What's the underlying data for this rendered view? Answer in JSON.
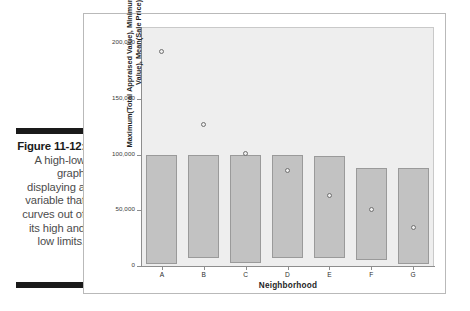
{
  "caption": {
    "figure_number": "Figure 11-12:",
    "body": "A high-low graph displaying a variable that curves out of its high and low limits."
  },
  "chart_data": {
    "type": "bar",
    "title": "",
    "subtitle": "",
    "xlabel": "Neighborhood",
    "ylabel": "Maximum(Total Appraised Value), Minimum(Appraised Land Value), Mean(Sale Price)",
    "categories": [
      "A",
      "B",
      "C",
      "D",
      "E",
      "F",
      "G"
    ],
    "ylim": [
      0,
      212000
    ],
    "yticks": [
      0,
      50000,
      100000,
      150000,
      200000
    ],
    "ytick_labels": [
      "0",
      "50,000",
      "100,000",
      "150,000",
      "200,000"
    ],
    "grid": false,
    "legend": false,
    "series": [
      {
        "name": "Maximum(Total Appraised Value)",
        "role": "bar-high",
        "values": [
          100000,
          100000,
          100000,
          100000,
          99000,
          88000,
          88000
        ]
      },
      {
        "name": "Minimum(Appraised Land Value)",
        "role": "bar-low",
        "values": [
          2000,
          7000,
          3000,
          7000,
          7000,
          5000,
          2000
        ]
      },
      {
        "name": "Mean(Sale Price)",
        "role": "point-marker",
        "values": [
          193000,
          127000,
          101000,
          86000,
          63000,
          51000,
          35000
        ]
      }
    ]
  },
  "axis": {
    "y_title": "Maximum(Total Appraised Value), Minimum(Appraised Land Value), Mean(Sale Price)",
    "x_title": "Neighborhood"
  },
  "colors": {
    "bar_fill": "#c2c2c2",
    "bar_stroke": "#9a9a9a",
    "plot_background": "#eeeeee",
    "marker_stroke": "#6f6f6f",
    "axis_line": "#8d8d8d",
    "frame_border": "#b9b9b9",
    "caption_rule": "#1a1a1a",
    "caption_text": "#4c4c4c"
  }
}
